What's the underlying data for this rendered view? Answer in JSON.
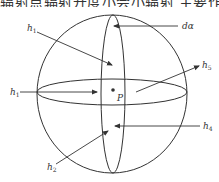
{
  "header": {
    "cropped_text": "辐射点辐射开度小会小辐射 主要作品"
  },
  "diagram": {
    "title": "",
    "point_label": "P",
    "labels": {
      "h1_top": {
        "base": "h",
        "sub": "1"
      },
      "h1_left": {
        "base": "h",
        "sub": "1"
      },
      "h2": {
        "base": "h",
        "sub": "2"
      },
      "h4": {
        "base": "h",
        "sub": "4"
      },
      "h5": {
        "base": "h",
        "sub": "5"
      },
      "da": "dα"
    },
    "colors": {
      "stroke": "#333333",
      "text": "#333333",
      "background": "#ffffff"
    }
  }
}
